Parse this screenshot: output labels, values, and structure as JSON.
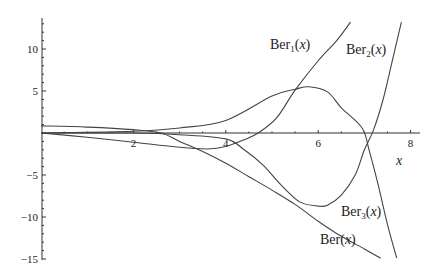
{
  "chart_data": {
    "type": "line",
    "title": "",
    "xlabel": "x",
    "ylabel": "",
    "xlim": [
      0,
      8.3
    ],
    "ylim": [
      -15,
      14
    ],
    "grid": false,
    "legend": "inline labels",
    "x_ticks": [
      "2",
      "4",
      "6",
      "8"
    ],
    "y_ticks": [
      "10",
      "5",
      "-5",
      "-10",
      "-15"
    ],
    "series": [
      {
        "name": "Ber(x)",
        "label_main": "Ber",
        "label_sub": "",
        "x": [
          0,
          1,
          2,
          2.6,
          3,
          3.5,
          4,
          4.5,
          5,
          5.5,
          6,
          6.5,
          7,
          7.35
        ],
        "y": [
          0.85,
          0.7,
          0.4,
          0.0,
          -1.0,
          -2.2,
          -3.6,
          -5.2,
          -6.8,
          -8.5,
          -10.5,
          -12.3,
          -13.8,
          -14.9
        ]
      },
      {
        "name": "Ber1(x)",
        "label_main": "Ber",
        "label_sub": "1",
        "x": [
          0,
          1,
          2,
          3,
          3.6,
          4,
          4.4,
          4.7,
          5.1,
          5.5,
          6.0,
          6.4,
          6.7
        ],
        "y": [
          0,
          -0.5,
          -1.1,
          -1.7,
          -1.9,
          -1.6,
          -0.8,
          0,
          1.8,
          5.1,
          8.6,
          11.0,
          13.2
        ]
      },
      {
        "name": "Ber2(x)",
        "label_main": "Ber",
        "label_sub": "2",
        "x": [
          0,
          2,
          3,
          4,
          4.4,
          4.8,
          5.2,
          5.6,
          6.0,
          6.2,
          6.5,
          6.8,
          7.0,
          7.2,
          7.4,
          7.6,
          7.8
        ],
        "y": [
          0,
          0,
          -0.2,
          -0.7,
          -2.0,
          -3.8,
          -6.2,
          -8.2,
          -8.7,
          -8.6,
          -7.4,
          -5.0,
          -2.0,
          0.4,
          3.9,
          8.5,
          13.2
        ]
      },
      {
        "name": "Ber3(x)",
        "label_main": "Ber",
        "label_sub": "3",
        "x": [
          0,
          2,
          3,
          4,
          5,
          5.5,
          5.8,
          6.2,
          6.5,
          6.95,
          7.1,
          7.3,
          7.5,
          7.7
        ],
        "y": [
          0,
          0.2,
          0.6,
          1.5,
          4.4,
          5.2,
          5.5,
          4.9,
          3.0,
          0.6,
          -2.0,
          -6.2,
          -10.9,
          -14.9
        ]
      }
    ]
  },
  "labels": {
    "ber": {
      "main": "Ber",
      "sub": "",
      "arg": "(x)"
    },
    "ber1": {
      "main": "Ber",
      "sub": "1",
      "arg": "(x)"
    },
    "ber2": {
      "main": "Ber",
      "sub": "2",
      "arg": "(x)"
    },
    "ber3": {
      "main": "Ber",
      "sub": "3",
      "arg": "(x)"
    },
    "x_axis": "x"
  }
}
